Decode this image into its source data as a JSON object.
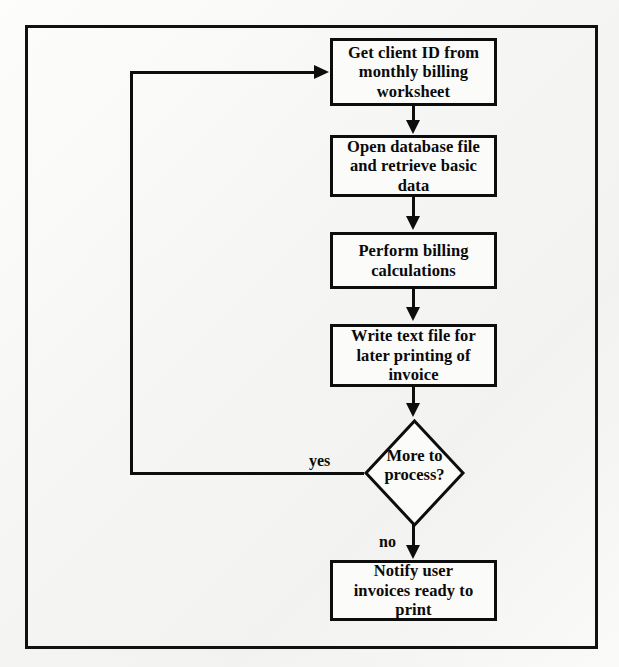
{
  "diagram": {
    "type": "flowchart",
    "colors": {
      "line": "#0d0d0d",
      "text": "#0a0a0a",
      "background": "#f6f6f4",
      "frame": "#111111"
    },
    "nodes": [
      {
        "id": "get-client-id",
        "shape": "process",
        "text": "Get client ID from monthly billing worksheet",
        "lines": [
          "Get client ID from",
          "monthly billing",
          "worksheet"
        ]
      },
      {
        "id": "open-database",
        "shape": "process",
        "text": "Open database file and retrieve basic data",
        "lines": [
          "Open database file",
          "and retrieve basic",
          "data"
        ]
      },
      {
        "id": "perform-billing",
        "shape": "process",
        "text": "Perform billing calculations",
        "lines": [
          "Perform billing",
          "calculations"
        ]
      },
      {
        "id": "write-text-file",
        "shape": "process",
        "text": "Write text file for later printing of invoice",
        "lines": [
          "Write text file for",
          "later printing of",
          "invoice"
        ]
      },
      {
        "id": "more-to-process",
        "shape": "decision",
        "text": "More to process?",
        "lines": [
          "More to",
          "process?"
        ]
      },
      {
        "id": "notify-user",
        "shape": "process",
        "text": "Notify user invoices ready to print",
        "lines": [
          "Notify user",
          "invoices ready to",
          "print"
        ]
      }
    ],
    "edges": [
      {
        "id": "e1",
        "from": "get-client-id",
        "to": "open-database",
        "label": ""
      },
      {
        "id": "e2",
        "from": "open-database",
        "to": "perform-billing",
        "label": ""
      },
      {
        "id": "e3",
        "from": "perform-billing",
        "to": "write-text-file",
        "label": ""
      },
      {
        "id": "e4",
        "from": "write-text-file",
        "to": "more-to-process",
        "label": ""
      },
      {
        "id": "e5",
        "from": "more-to-process",
        "to": "get-client-id",
        "label": "yes"
      },
      {
        "id": "e6",
        "from": "more-to-process",
        "to": "notify-user",
        "label": "no"
      }
    ],
    "labels": {
      "yes": "yes",
      "no": "no"
    }
  }
}
